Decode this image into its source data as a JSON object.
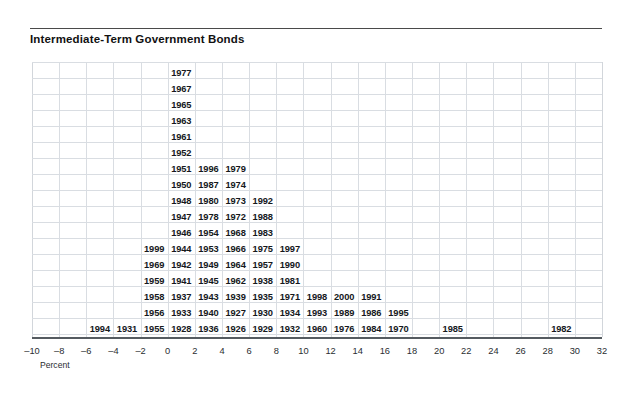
{
  "chart_data": {
    "type": "bar",
    "variant": "stacked-year-histogram",
    "title": "Intermediate-Term Government Bonds",
    "xlabel": "Percent",
    "ylabel": "",
    "xlim": [
      -10,
      32
    ],
    "xtick_step": 2,
    "bin_width": 2,
    "grid": true,
    "legend": null,
    "xticks": [
      "-10",
      "-8",
      "-6",
      "-4",
      "-2",
      "0",
      "2",
      "4",
      "6",
      "8",
      "10",
      "12",
      "14",
      "16",
      "18",
      "20",
      "22",
      "24",
      "26",
      "28",
      "30",
      "32"
    ],
    "bins": [
      {
        "range": [
          -10,
          -8
        ],
        "center": -9,
        "count": 0,
        "years": []
      },
      {
        "range": [
          -8,
          -6
        ],
        "center": -7,
        "count": 0,
        "years": []
      },
      {
        "range": [
          -6,
          -4
        ],
        "center": -5,
        "count": 1,
        "years": [
          "1994"
        ]
      },
      {
        "range": [
          -4,
          -2
        ],
        "center": -3,
        "count": 1,
        "years": [
          "1931"
        ]
      },
      {
        "range": [
          -2,
          0
        ],
        "center": -1,
        "count": 6,
        "years": [
          "1999",
          "1969",
          "1959",
          "1958",
          "1956",
          "1955"
        ]
      },
      {
        "range": [
          0,
          2
        ],
        "center": 1,
        "count": 16,
        "years": [
          "1977",
          "1967",
          "1965",
          "1963",
          "1961",
          "1952",
          "1951",
          "1950",
          "1948",
          "1947",
          "1946",
          "1944",
          "1942",
          "1941",
          "1937",
          "1933",
          "1928"
        ]
      },
      {
        "range": [
          2,
          4
        ],
        "center": 3,
        "count": 11,
        "years": [
          "1996",
          "1987",
          "1980",
          "1978",
          "1954",
          "1953",
          "1949",
          "1945",
          "1943",
          "1940",
          "1936"
        ]
      },
      {
        "range": [
          4,
          6
        ],
        "center": 5,
        "count": 11,
        "years": [
          "1979",
          "1974",
          "1973",
          "1972",
          "1968",
          "1966",
          "1964",
          "1962",
          "1939",
          "1927",
          "1926"
        ]
      },
      {
        "range": [
          6,
          8
        ],
        "center": 7,
        "count": 9,
        "years": [
          "1992",
          "1988",
          "1983",
          "1975",
          "1957",
          "1938",
          "1935",
          "1930",
          "1929"
        ]
      },
      {
        "range": [
          8,
          10
        ],
        "center": 9,
        "count": 7,
        "years": [
          "1997",
          "1990",
          "1981",
          "1971",
          "1934",
          "1932"
        ]
      },
      {
        "range": [
          10,
          12
        ],
        "center": 11,
        "count": 3,
        "years": [
          "1998",
          "1993",
          "1960"
        ]
      },
      {
        "range": [
          12,
          14
        ],
        "center": 13,
        "count": 3,
        "years": [
          "2000",
          "1989",
          "1976"
        ]
      },
      {
        "range": [
          14,
          16
        ],
        "center": 15,
        "count": 3,
        "years": [
          "1991",
          "1986",
          "1984"
        ]
      },
      {
        "range": [
          16,
          18
        ],
        "center": 17,
        "count": 2,
        "years": [
          "1995",
          "1970"
        ]
      },
      {
        "range": [
          18,
          20
        ],
        "center": 19,
        "count": 0,
        "years": []
      },
      {
        "range": [
          20,
          22
        ],
        "center": 21,
        "count": 1,
        "years": [
          "1985"
        ]
      },
      {
        "range": [
          22,
          24
        ],
        "center": 23,
        "count": 0,
        "years": []
      },
      {
        "range": [
          24,
          26
        ],
        "center": 25,
        "count": 0,
        "years": []
      },
      {
        "range": [
          26,
          28
        ],
        "center": 27,
        "count": 0,
        "years": []
      },
      {
        "range": [
          28,
          30
        ],
        "center": 29,
        "count": 1,
        "years": [
          "1982"
        ]
      },
      {
        "range": [
          30,
          32
        ],
        "center": 31,
        "count": 0,
        "years": []
      }
    ],
    "columns": [
      {
        "bin_index": 5,
        "range_label": "0 to 2",
        "years_top_to_bottom": [
          "1977",
          "1967",
          "1965",
          "1963",
          "1961",
          "1952",
          "1951",
          "1950",
          "1948",
          "1947",
          "1946",
          "1944",
          "1942",
          "1941",
          "1937",
          "1933",
          "1928"
        ]
      },
      {
        "bin_index": 4,
        "range_label": "-2 to 0",
        "years_top_to_bottom": [
          "1999",
          "1969",
          "1959",
          "1958",
          "1956",
          "1955"
        ]
      },
      {
        "bin_index": 6,
        "range_label": "2 to 4",
        "years_top_to_bottom": [
          "1996",
          "1987",
          "1980",
          "1978",
          "1954",
          "1953",
          "1949",
          "1945",
          "1943",
          "1940",
          "1936"
        ]
      },
      {
        "bin_index": 7,
        "range_label": "4 to 6",
        "years_top_to_bottom": [
          "1979",
          "1974",
          "1973",
          "1972",
          "1968",
          "1966",
          "1964",
          "1962",
          "1939",
          "1927",
          "1926"
        ]
      },
      {
        "bin_index": 8,
        "range_label": "6 to 8",
        "years_top_to_bottom": [
          "1992",
          "1988",
          "1983",
          "1975",
          "1957",
          "1938",
          "1935",
          "1930",
          "1929"
        ]
      },
      {
        "bin_index": 9,
        "range_label": "8 to 10",
        "years_top_to_bottom": [
          "1997",
          "1990",
          "1981",
          "1971",
          "1934",
          "1932"
        ]
      },
      {
        "bin_index": 10,
        "range_label": "10 to 12",
        "years_top_to_bottom": [
          "1998",
          "1993",
          "1960"
        ]
      },
      {
        "bin_index": 11,
        "range_label": "12 to 14",
        "years_top_to_bottom": [
          "2000",
          "1989",
          "1976"
        ]
      },
      {
        "bin_index": 12,
        "range_label": "14 to 16",
        "years_top_to_bottom": [
          "1991",
          "1986",
          "1984"
        ]
      },
      {
        "bin_index": 13,
        "range_label": "16 to 18",
        "years_top_to_bottom": [
          "1995",
          "1970"
        ]
      },
      {
        "bin_index": 2,
        "range_label": "-6 to -4",
        "years_top_to_bottom": [
          "1994"
        ]
      },
      {
        "bin_index": 3,
        "range_label": "-4 to -2",
        "years_top_to_bottom": [
          "1931"
        ]
      },
      {
        "bin_index": 15,
        "range_label": "20 to 22",
        "years_top_to_bottom": [
          "1985"
        ]
      },
      {
        "bin_index": 19,
        "range_label": "28 to 30",
        "years_top_to_bottom": [
          "1982"
        ]
      }
    ]
  },
  "colors": {
    "grid": "#d9dde2",
    "axis": "#555b60",
    "rule": "#4a4a4a",
    "text": "#15181c",
    "background": "#ffffff"
  }
}
